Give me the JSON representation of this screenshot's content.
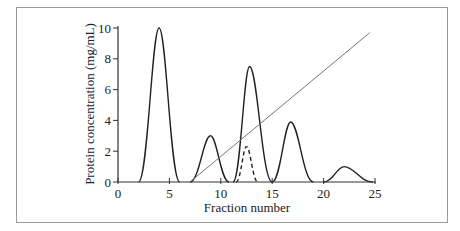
{
  "chart_data": {
    "type": "line",
    "title": "",
    "xlabel": "Fraction number",
    "ylabel": "Protein concentration (mg/mL)",
    "xlim": [
      0,
      25
    ],
    "ylim": [
      0,
      10
    ],
    "xticks": [
      0,
      5,
      10,
      15,
      20,
      25
    ],
    "yticks": [
      0,
      2,
      4,
      6,
      8,
      10
    ],
    "grid": false,
    "legend": null,
    "series": [
      {
        "name": "Protein peak 1",
        "style": "solid",
        "x": [
          2,
          4,
          6
        ],
        "y": [
          0,
          10,
          0
        ]
      },
      {
        "name": "Protein peak 2",
        "style": "solid",
        "x": [
          7,
          9,
          10.8
        ],
        "y": [
          0,
          3,
          0
        ]
      },
      {
        "name": "Protein peak 3",
        "style": "solid",
        "x": [
          11.2,
          12.8,
          15
        ],
        "y": [
          0,
          7.5,
          0
        ]
      },
      {
        "name": "Protein peak 3 (minor component)",
        "style": "dashed",
        "x": [
          11.5,
          12.5,
          13.6
        ],
        "y": [
          0,
          2.3,
          0
        ]
      },
      {
        "name": "Protein peak 4",
        "style": "solid",
        "x": [
          15,
          16.8,
          19
        ],
        "y": [
          0,
          3.9,
          0
        ]
      },
      {
        "name": "Protein peak 5",
        "style": "solid",
        "x": [
          20,
          22,
          24.8
        ],
        "y": [
          0,
          1,
          0
        ]
      },
      {
        "name": "Gradient",
        "style": "thin-gray",
        "x": [
          7,
          24.5
        ],
        "y": [
          0,
          9.7
        ]
      }
    ]
  },
  "labels": {
    "xlabel": "Fraction number",
    "ylabel": "Protein concentration (mg/mL)",
    "xticks": [
      "0",
      "5",
      "10",
      "15",
      "20",
      "25"
    ],
    "yticks": [
      "0",
      "2",
      "4",
      "6",
      "8",
      "10"
    ]
  }
}
